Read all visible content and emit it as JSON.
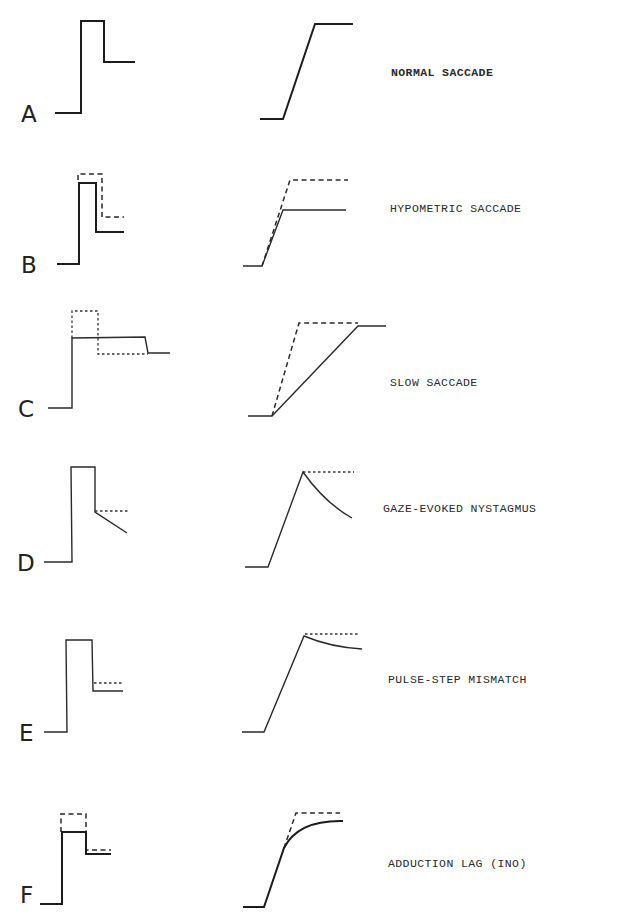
{
  "figure": {
    "panels": [
      {
        "id": "A",
        "letter": "A",
        "caption": "NORMAL SACCADE"
      },
      {
        "id": "B",
        "letter": "B",
        "caption": "HYPOMETRIC SACCADE"
      },
      {
        "id": "C",
        "letter": "C",
        "caption": "SLOW SACCADE"
      },
      {
        "id": "D",
        "letter": "D",
        "caption": "GAZE-EVOKED NYSTAGMUS"
      },
      {
        "id": "E",
        "letter": "E",
        "caption": "PULSE-STEP MISMATCH"
      },
      {
        "id": "F",
        "letter": "F",
        "caption": "ADDUCTION LAG (INO)"
      }
    ],
    "legend": {
      "left_column": "innervation (pulse-step) signal",
      "right_column": "eye position trace",
      "solid_line": "actual",
      "dashed_line": "normal / expected"
    }
  }
}
